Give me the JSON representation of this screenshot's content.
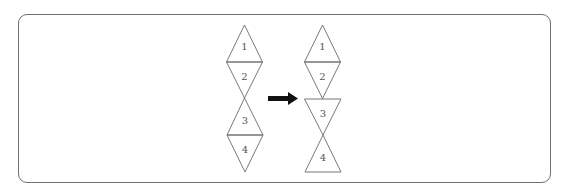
{
  "diagram": {
    "colors": {
      "stroke": "#6a6a6a",
      "arrow": "#111111",
      "frame": "#6f6f6f",
      "text": "#555555"
    },
    "left_figure": {
      "labels": [
        "1",
        "2",
        "3",
        "4"
      ]
    },
    "arrow": {
      "direction": "right",
      "meaning": "transforms-to"
    },
    "right_figure": {
      "labels": [
        "1",
        "2",
        "3",
        "4"
      ]
    }
  }
}
